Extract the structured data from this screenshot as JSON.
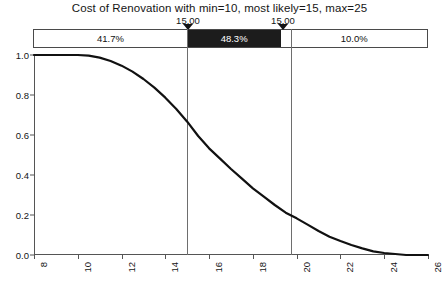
{
  "chart_data": {
    "type": "line",
    "title": "Cost of Renovation with min=10, most likely=15, max=25",
    "xlabel": "",
    "ylabel": "",
    "xlim": [
      8,
      26
    ],
    "ylim": [
      0.0,
      1.0
    ],
    "grid": false,
    "legend": "none",
    "xticks": [
      "8",
      "10",
      "12",
      "14",
      "16",
      "18",
      "20",
      "22",
      "24",
      "26"
    ],
    "xtick_values": [
      8,
      10,
      12,
      14,
      16,
      18,
      20,
      22,
      24,
      26
    ],
    "yticks": [
      "0.0",
      "0.2",
      "0.4",
      "0.6",
      "0.8",
      "1.0"
    ],
    "ytick_values": [
      0.0,
      0.2,
      0.4,
      0.6,
      0.8,
      1.0
    ],
    "series": [
      {
        "name": "Reliability (1 - CDF)",
        "color": "#111111",
        "x": [
          8.0,
          9.0,
          10.0,
          10.5,
          11.0,
          11.5,
          12.0,
          12.5,
          13.0,
          13.5,
          14.0,
          14.5,
          15.0,
          15.5,
          16.0,
          16.5,
          17.0,
          17.5,
          18.0,
          18.5,
          19.0,
          19.5,
          20.0,
          20.5,
          21.0,
          21.5,
          22.0,
          22.5,
          23.0,
          23.5,
          24.0,
          25.0,
          26.0
        ],
        "values": [
          1.0,
          1.0,
          1.0,
          0.9967,
          0.9867,
          0.97,
          0.9467,
          0.9167,
          0.88,
          0.8367,
          0.7867,
          0.73,
          0.6667,
          0.595,
          0.5333,
          0.4817,
          0.43,
          0.3817,
          0.3333,
          0.2917,
          0.25,
          0.2117,
          0.1833,
          0.1517,
          0.12,
          0.0917,
          0.07,
          0.05,
          0.0333,
          0.0183,
          0.01,
          0.0,
          0.0
        ]
      }
    ],
    "markers": [
      {
        "name": "lower-bound-marker",
        "label": "15.00",
        "x": 15.0
      },
      {
        "name": "upper-bound-marker",
        "label": "15.00",
        "x": 19.75
      }
    ],
    "probability_band": {
      "segments": [
        {
          "name": "left-segment",
          "label": "41.7%",
          "value": 41.7,
          "fill": "#ffffff",
          "text_color": "#101010",
          "start_frac": 0.0,
          "end_frac": 0.3889
        },
        {
          "name": "middle-segment",
          "label": "48.3%",
          "value": 48.3,
          "fill": "#1c1c1c",
          "text_color": "#ffffff",
          "start_frac": 0.3889,
          "end_frac": 0.6296
        },
        {
          "name": "right-segment",
          "label": "10.0%",
          "value": 10.0,
          "fill": "#ffffff",
          "text_color": "#101010",
          "start_frac": 0.6296,
          "end_frac": 1.0
        }
      ]
    },
    "colors": {
      "curve": "#111111",
      "axis": "#555555",
      "band_dark": "#1c1c1c",
      "band_border": "#4a4a4a",
      "marker_line": "#6e6e6e",
      "background": "#ffffff"
    }
  }
}
